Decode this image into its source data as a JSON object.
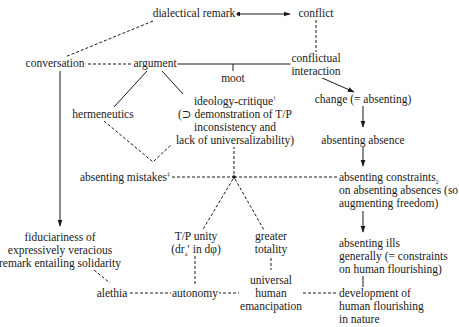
{
  "diagram": {
    "nodes": {
      "dialectical_remark": {
        "label": "dialectical remark"
      },
      "conflict": {
        "label": "conflict"
      },
      "conversation": {
        "label": "conversation"
      },
      "argument": {
        "label": "argument"
      },
      "conflictual_interaction": {
        "lines": [
          "conflictual",
          "interaction"
        ]
      },
      "moot": {
        "label": "moot"
      },
      "hermeneutics": {
        "label": "hermeneutics"
      },
      "ideology_critique": {
        "lines": [
          "ideology-critique",
          "(⊃ demonstration of T/P",
          "inconsistency and",
          "lack of universalizability)"
        ],
        "superscript": "†"
      },
      "change": {
        "label": "change (= absenting)"
      },
      "absenting_absence": {
        "label": "absenting absence"
      },
      "absenting_mistakes": {
        "label": "absenting mistakes",
        "superscript": "‡"
      },
      "absenting_constraints": {
        "line1": "absenting constraints",
        "subscript": "2",
        "lines_rest": [
          "on absenting absences (so",
          "augmenting freedom)"
        ]
      },
      "fiduciariness": {
        "lines": [
          "fiduciariness of",
          "expressively veracious",
          "remark entailing solidarity"
        ]
      },
      "tp_unity": {
        "line1": "T/P unity",
        "line2_pre": "(dr",
        "line2_sub": "a",
        "line2_post": "′ in dφ)"
      },
      "greater_totality": {
        "lines": [
          "greater",
          "totality"
        ]
      },
      "absenting_ills": {
        "lines": [
          "absenting ills",
          "generally (= constraints",
          "on human flourishing)"
        ]
      },
      "alethia": {
        "label": "alethia"
      },
      "autonomy": {
        "label": "autonomy"
      },
      "universal_human_emancipation": {
        "lines": [
          "universal",
          "human",
          "emancipation"
        ]
      },
      "development": {
        "lines": [
          "development of",
          "human flourishing",
          "in nature"
        ]
      }
    },
    "edges": [
      {
        "from": "dialectical_remark",
        "to": "conflict",
        "style": "solid",
        "arrow": "both"
      },
      {
        "from": "dialectical_remark",
        "to": "conversation",
        "style": "dashed",
        "arrow": "none"
      },
      {
        "from": "conflict",
        "to": "conflictual_interaction",
        "style": "dashed",
        "arrow": "none"
      },
      {
        "from": "conversation",
        "to": "argument",
        "style": "dashed",
        "arrow": "none"
      },
      {
        "from": "argument",
        "to": "conflictual_interaction",
        "style": "solid",
        "arrow": "none"
      },
      {
        "from": "argument_line",
        "to": "moot",
        "style": "solid",
        "arrow": "none"
      },
      {
        "from": "argument",
        "to": "hermeneutics",
        "style": "solid",
        "arrow": "none"
      },
      {
        "from": "argument",
        "to": "ideology_critique",
        "style": "solid",
        "arrow": "none"
      },
      {
        "from": "conflictual_interaction",
        "to": "change",
        "style": "solid",
        "arrow": "forward"
      },
      {
        "from": "change",
        "to": "absenting_absence",
        "style": "solid",
        "arrow": "forward"
      },
      {
        "from": "absenting_absence",
        "to": "absenting_constraints",
        "style": "solid",
        "arrow": "forward"
      },
      {
        "from": "absenting_constraints",
        "to": "absenting_ills",
        "style": "solid",
        "arrow": "forward"
      },
      {
        "from": "absenting_ills",
        "to": "development",
        "style": "solid",
        "arrow": "forward"
      },
      {
        "from": "hermeneutics",
        "to": "diamond_point",
        "style": "dashed",
        "arrow": "none"
      },
      {
        "from": "ideology_critique",
        "to": "diamond_point",
        "style": "dashed",
        "arrow": "none"
      },
      {
        "from": "ideology_critique",
        "to": "junction",
        "style": "dashed",
        "arrow": "none"
      },
      {
        "from": "absenting_mistakes",
        "to": "junction",
        "style": "dashed",
        "arrow": "none"
      },
      {
        "from": "junction",
        "to": "absenting_constraints",
        "style": "dashed",
        "arrow": "none"
      },
      {
        "from": "junction",
        "to": "tp_unity",
        "style": "dashed",
        "arrow": "none"
      },
      {
        "from": "junction",
        "to": "greater_totality",
        "style": "dashed",
        "arrow": "none"
      },
      {
        "from": "conversation",
        "to": "fiduciariness",
        "style": "solid",
        "arrow": "forward"
      },
      {
        "from": "fiduciariness",
        "to": "alethia",
        "style": "dashed",
        "arrow": "none"
      },
      {
        "from": "tp_unity",
        "to": "autonomy",
        "style": "dashed",
        "arrow": "none"
      },
      {
        "from": "greater_totality",
        "to": "universal_human_emancipation",
        "style": "dashed",
        "arrow": "none"
      },
      {
        "from": "alethia",
        "to": "autonomy",
        "style": "dashed",
        "arrow": "none"
      },
      {
        "from": "autonomy",
        "to": "universal_human_emancipation",
        "style": "dashed",
        "arrow": "none"
      },
      {
        "from": "universal_human_emancipation",
        "to": "development",
        "style": "dashed",
        "arrow": "none"
      }
    ],
    "colors": {
      "ink": "#1a1a1a",
      "background": "#ffffff"
    }
  }
}
